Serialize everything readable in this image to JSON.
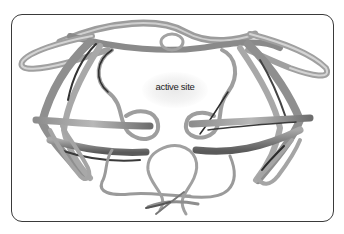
{
  "diagram": {
    "type": "protein-ribbon-structure",
    "labels": {
      "active_site": "active site"
    },
    "colors": {
      "ribbon": "#9a9a9a",
      "ribbon_dark": "#3c3c3c",
      "ribbon_light": "#c4c4c4",
      "frame": "#3a3a3a",
      "glow": "#e9e9e9",
      "background": "#ffffff"
    }
  }
}
